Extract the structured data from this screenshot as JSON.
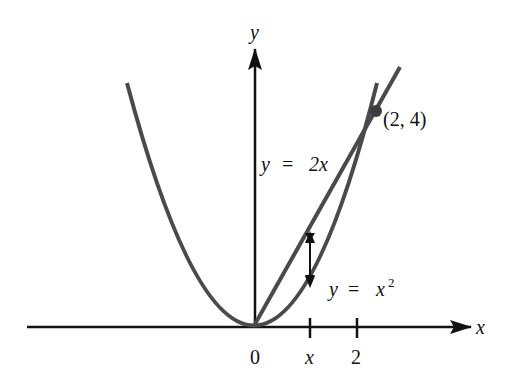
{
  "figure": {
    "axes": {
      "x_label": "x",
      "y_label": "y",
      "origin_label": "0",
      "ticks": [
        {
          "label": "x",
          "px": 310
        },
        {
          "label": "2",
          "px": 357
        }
      ]
    },
    "curves": {
      "parabola": {
        "label_y": "y",
        "label_eq": "=",
        "label_rhs": "x",
        "label_exp": "2",
        "equation": "y = x^2"
      },
      "line": {
        "label_y": "y",
        "label_eq": "=",
        "label_rhs": "2x",
        "equation": "y = 2x"
      }
    },
    "intersection": {
      "label": "(2, 4)",
      "x": 2,
      "y": 4
    },
    "colors": {
      "curve": "#4a4a4a",
      "axis": "#111111",
      "background": "#ffffff"
    }
  }
}
